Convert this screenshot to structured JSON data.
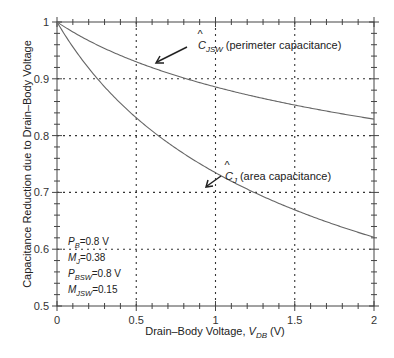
{
  "chart_data": {
    "type": "line",
    "title": "",
    "xlabel": "Drain–Body Voltage, V_DB (V)",
    "xlabel_parts": {
      "main": "Drain–Body Voltage, ",
      "var": "V",
      "sub": "DB",
      "unit": " (V)"
    },
    "ylabel": "Capacitance Reduction due to Drain–Body Voltage",
    "xlim": [
      0,
      2
    ],
    "ylim": [
      0.5,
      1
    ],
    "xticks": [
      "0",
      "0.5",
      "1",
      "1.5",
      "2"
    ],
    "yticks": [
      "0.5",
      "0.6",
      "0.7",
      "0.8",
      "0.9",
      "1"
    ],
    "grid": true,
    "x": [
      0,
      0.25,
      0.5,
      0.75,
      1.0,
      1.25,
      1.5,
      1.75,
      2.0
    ],
    "series": [
      {
        "name": "Ĉ_JSW (perimeter capacitance)",
        "symbol": "C",
        "sub": "JSW",
        "desc": "(perimeter capacitance)",
        "values": [
          1.0,
          0.96,
          0.93,
          0.906,
          0.885,
          0.868,
          0.853,
          0.84,
          0.829
        ]
      },
      {
        "name": "Ĉ_J (area capacitance)",
        "symbol": "C",
        "sub": "J",
        "desc": "(area capacitance)",
        "values": [
          1.0,
          0.902,
          0.832,
          0.778,
          0.735,
          0.699,
          0.669,
          0.644,
          0.621
        ]
      }
    ],
    "parameters": [
      {
        "name": "P",
        "sub": "B",
        "value": "=0.8 V"
      },
      {
        "name": "M",
        "sub": "J",
        "value": "=0.38"
      },
      {
        "name": "P",
        "sub": "BSW",
        "value": "=0.8 V"
      },
      {
        "name": "M",
        "sub": "JSW",
        "value": "=0.15"
      }
    ]
  }
}
